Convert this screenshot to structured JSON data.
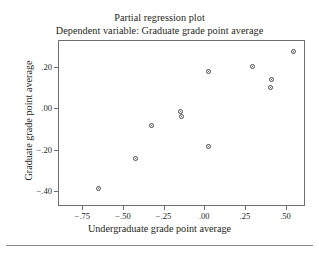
{
  "chart_data": {
    "type": "scatter",
    "title": "Partial regression plot",
    "subtitle": "Dependent variable: Graduate grade point average",
    "xlabel": "Undergraduate grade point average",
    "ylabel": "Graduate grade point average",
    "xlim": [
      -0.9,
      0.62
    ],
    "ylim": [
      -0.47,
      0.33
    ],
    "grid": false,
    "legend": null,
    "xticks": [
      -0.75,
      -0.5,
      -0.25,
      0.0,
      0.25,
      0.5
    ],
    "xticklabels": [
      "-.75",
      "-.50",
      "-.25",
      ".00",
      ".25",
      ".50"
    ],
    "yticks": [
      0.2,
      0.0,
      -0.2,
      -0.4
    ],
    "yticklabels": [
      ".20",
      ".00",
      "-.20",
      "-.40"
    ],
    "marker": "open-circle",
    "marker_color": "#4a4a4d",
    "points": [
      {
        "x": -0.66,
        "y": -0.38
      },
      {
        "x": -0.43,
        "y": -0.235
      },
      {
        "x": -0.33,
        "y": -0.075
      },
      {
        "x": -0.15,
        "y": -0.01
      },
      {
        "x": -0.145,
        "y": -0.035
      },
      {
        "x": 0.02,
        "y": -0.18
      },
      {
        "x": 0.02,
        "y": 0.185
      },
      {
        "x": 0.29,
        "y": 0.205
      },
      {
        "x": 0.41,
        "y": 0.145
      },
      {
        "x": 0.4,
        "y": 0.105
      },
      {
        "x": 0.54,
        "y": 0.28
      }
    ]
  }
}
